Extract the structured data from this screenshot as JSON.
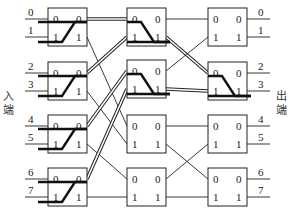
{
  "labels": {
    "input_side": [
      "入",
      "端"
    ],
    "output_side": [
      "出",
      "端"
    ],
    "port_in_0": "0",
    "port_in_1": "1",
    "port_out_0": "0",
    "port_out_1": "1"
  },
  "inputs": [
    "0",
    "1",
    "2",
    "3",
    "4",
    "5",
    "6",
    "7"
  ],
  "outputs": [
    "0",
    "1",
    "2",
    "3",
    "4",
    "5",
    "6",
    "7"
  ],
  "layout": {
    "stage_x": [
      48,
      127,
      208
    ],
    "box_w": 39,
    "box_h": 38,
    "row_y": [
      8,
      62,
      115,
      168
    ],
    "stage2_row_y": [
      8,
      60,
      115,
      168
    ],
    "port0_off": 11,
    "port1_off": 29,
    "in_line_start": 25,
    "out_line_end": 270
  },
  "stage1_to_stage2": [
    {
      "from": [
        0,
        0
      ],
      "to": [
        0,
        0
      ],
      "style": "double"
    },
    {
      "from": [
        0,
        1
      ],
      "to": [
        2,
        0
      ],
      "style": "thin"
    },
    {
      "from": [
        1,
        0
      ],
      "to": [
        0,
        1
      ],
      "style": "double"
    },
    {
      "from": [
        1,
        1
      ],
      "to": [
        2,
        1
      ],
      "style": "thin"
    },
    {
      "from": [
        2,
        0
      ],
      "to": [
        1,
        0
      ],
      "style": "double"
    },
    {
      "from": [
        2,
        1
      ],
      "to": [
        3,
        0
      ],
      "style": "thin"
    },
    {
      "from": [
        3,
        0
      ],
      "to": [
        1,
        1
      ],
      "style": "double"
    },
    {
      "from": [
        3,
        1
      ],
      "to": [
        3,
        1
      ],
      "style": "thin"
    }
  ],
  "stage2_to_stage3": [
    {
      "from": [
        0,
        0
      ],
      "to": [
        0,
        0
      ],
      "style": "thin"
    },
    {
      "from": [
        0,
        1
      ],
      "to": [
        1,
        0
      ],
      "style": "double"
    },
    {
      "from": [
        1,
        0
      ],
      "to": [
        0,
        1
      ],
      "style": "thin"
    },
    {
      "from": [
        1,
        1
      ],
      "to": [
        1,
        1
      ],
      "style": "double"
    },
    {
      "from": [
        2,
        0
      ],
      "to": [
        2,
        0
      ],
      "style": "thin"
    },
    {
      "from": [
        2,
        1
      ],
      "to": [
        3,
        0
      ],
      "style": "thin"
    },
    {
      "from": [
        3,
        0
      ],
      "to": [
        2,
        1
      ],
      "style": "thin"
    },
    {
      "from": [
        3,
        1
      ],
      "to": [
        3,
        1
      ],
      "style": "thin"
    }
  ],
  "highlighted_switch_paths": [
    {
      "stage": 0,
      "box": 0,
      "routes": [
        [
          "in0",
          "out0"
        ],
        [
          "in1",
          "out0"
        ]
      ]
    },
    {
      "stage": 0,
      "box": 1,
      "routes": [
        [
          "in0",
          "out0"
        ],
        [
          "in1",
          "out0"
        ]
      ]
    },
    {
      "stage": 0,
      "box": 2,
      "routes": [
        [
          "in0",
          "out0"
        ],
        [
          "in1",
          "out0"
        ]
      ]
    },
    {
      "stage": 0,
      "box": 3,
      "routes": [
        [
          "in0",
          "out0"
        ],
        [
          "in1",
          "out0"
        ]
      ]
    },
    {
      "stage": 1,
      "box": 0,
      "routes": [
        [
          "in0",
          "out1"
        ],
        [
          "in1",
          "out1"
        ]
      ]
    },
    {
      "stage": 1,
      "box": 1,
      "routes": [
        [
          "in0",
          "out1"
        ],
        [
          "in1",
          "out1"
        ]
      ]
    },
    {
      "stage": 2,
      "box": 1,
      "routes": [
        [
          "in0",
          "out1"
        ],
        [
          "in1",
          "out1"
        ]
      ]
    }
  ]
}
